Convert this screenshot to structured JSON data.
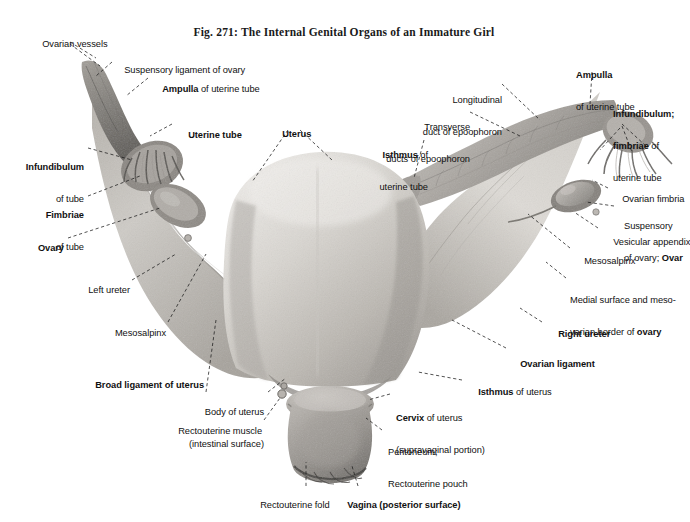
{
  "figure": {
    "title": "Fig. 271: The Internal Genital Organs of an Immature Girl",
    "subject": "internal genital organs of an immature girl",
    "style": "grayscale anatomical halftone plate with dashed leader lines"
  },
  "labels": {
    "ovarian_vessels": {
      "line1": "Ovarian vessels"
    },
    "suspensory_lig_ovary": {
      "line1": "Suspensory ligament of ovary"
    },
    "ampulla_left": {
      "bold1": "Ampulla",
      "rest1": " of uterine tube"
    },
    "uterine_tube": {
      "line1": "Uterine tube"
    },
    "infundibulum_left": {
      "bold1": "Infundibulum",
      "line2": "of tube"
    },
    "fimbriae_left": {
      "bold1": "Fimbriae",
      "line2": "of tube"
    },
    "ovary_left": {
      "line1": "Ovary"
    },
    "left_ureter": {
      "line1": "Left ureter"
    },
    "mesosalpinx_left": {
      "line1": "Mesosalpinx"
    },
    "broad_ligament": {
      "line1": "Broad ligament of uterus"
    },
    "body_of_uterus": {
      "line1": "Body of uterus",
      "line2": "(intestinal surface)"
    },
    "rectouterine_muscle": {
      "line1": "Rectouterine muscle"
    },
    "rectouterine_fold": {
      "line1": "Rectouterine fold"
    },
    "vagina": {
      "line1": "Vagina (posterior surface)"
    },
    "uterus": {
      "line1": "Uterus"
    },
    "longitudinal_duct": {
      "line1": "Longitudinal",
      "line2": "duct of epoophoron"
    },
    "transverse_ducts": {
      "line1": "Transverse",
      "line2": "ducts of epoophoron"
    },
    "isthmus_uterine_tube": {
      "bold1": "Isthmus",
      "rest1": " of",
      "line2": "uterine tube"
    },
    "ampulla_right": {
      "bold1": "Ampulla",
      "line2": "of uterine tube"
    },
    "infundibulum_right": {
      "bold1": "Infundibulum;",
      "bold2": "fimbriae",
      "rest2": " of",
      "line3": "uterine tube"
    },
    "ovarian_fimbria": {
      "line1": "Ovarian fimbria"
    },
    "suspensory_right": {
      "line1": "Suspensory",
      "line2a": "of ovary; ",
      "bold2b": "Ovar"
    },
    "vesicular_appendix": {
      "line1": "Vesicular appendix"
    },
    "mesosalpinx_right": {
      "line1": "Mesosalpinx"
    },
    "medial_surface": {
      "line1": "Medial surface and meso-",
      "line2a": "varian border of ",
      "bold2b": "ovary"
    },
    "right_ureter": {
      "line1": "Right ureter"
    },
    "ovarian_ligament": {
      "line1": "Ovarian ligament"
    },
    "isthmus_uterus": {
      "bold1": "Isthmus",
      "rest1": " of uterus"
    },
    "cervix": {
      "bold1": "Cervix",
      "rest1": " of uterus",
      "line2": "(supravaginal portion)"
    },
    "peritoneum": {
      "line1": "Peritoneum;",
      "line2": "Rectouterine pouch"
    }
  },
  "colors": {
    "background": "#ffffff",
    "text": "#111111",
    "leader": "#1a1a1a",
    "tissue_light": "#e3e1de",
    "tissue_mid": "#b9b6b1",
    "tissue_dark": "#8d8a85",
    "tissue_deep": "#5e5c58"
  }
}
